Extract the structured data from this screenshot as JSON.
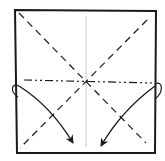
{
  "diagram": {
    "type": "origami-fold-diagram",
    "colors": {
      "outline": "#1a1a1a",
      "crease": "#1a1a1a",
      "center_line": "#bdbdbd",
      "background": "#ffffff"
    },
    "square": {
      "corners": [
        [
          15,
          10
        ],
        [
          156,
          11
        ],
        [
          155,
          153
        ],
        [
          17,
          153
        ]
      ]
    },
    "lines": [
      {
        "name": "valley-fold-diagonal-1",
        "style": "dashed",
        "from": [
          19,
          13
        ],
        "to": [
          146,
          143
        ]
      },
      {
        "name": "valley-fold-diagonal-2",
        "style": "dashed",
        "from": [
          147,
          20
        ],
        "to": [
          20,
          148
        ]
      },
      {
        "name": "mountain-fold-horizontal",
        "style": "dash-dot",
        "from": [
          24,
          80
        ],
        "to": [
          152,
          83
        ]
      },
      {
        "name": "center-crease-vertical",
        "style": "thin-solid",
        "from": [
          86,
          16
        ],
        "to": [
          86,
          147
        ]
      }
    ],
    "arrows": [
      {
        "name": "fold-arrow-left",
        "from": [
          19,
          86
        ],
        "to": [
          73,
          143
        ]
      },
      {
        "name": "fold-arrow-right",
        "from": [
          155,
          86
        ],
        "to": [
          101,
          146
        ]
      }
    ]
  }
}
